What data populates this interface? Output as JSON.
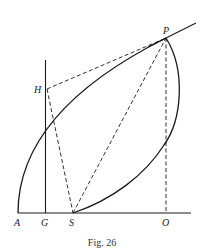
{
  "figure": {
    "caption": "Fig. 26",
    "points": {
      "A": {
        "label": "A",
        "x": 18,
        "y": 213
      },
      "G": {
        "label": "G",
        "x": 45,
        "y": 213
      },
      "S": {
        "label": "S",
        "x": 73,
        "y": 213
      },
      "O": {
        "label": "O",
        "x": 166,
        "y": 213
      },
      "H": {
        "label": "H",
        "x": 47,
        "y": 89
      },
      "P": {
        "label": "P",
        "x": 166,
        "y": 38
      }
    },
    "lines": {
      "baseline": "A to beyond O (solid)",
      "vertical_at_G": "solid line through G and H",
      "tangent_at_P": "solid tangent line through P",
      "HP": "dashed",
      "HS": "dashed",
      "SP": "dashed",
      "PO": "dashed"
    },
    "curves": {
      "parabola": "from A to P (solid)",
      "orbit_arc": "from P to S (solid)"
    },
    "colors": {
      "ink": "#1a1a1a",
      "background": "#ffffff"
    }
  }
}
